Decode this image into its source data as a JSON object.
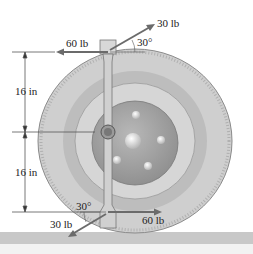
{
  "diagram": {
    "type": "wrench-on-tire-forces",
    "forces": {
      "top_horizontal": "60 lb",
      "top_angled": "30 lb",
      "bottom_horizontal": "60 lb",
      "bottom_angled": "30 lb"
    },
    "angles": {
      "top": "30°",
      "bottom": "30°"
    },
    "dimensions": {
      "upper": "16 in",
      "lower": "16 in"
    },
    "colors": {
      "tire": "#c9c9c9",
      "tire_inner": "#b5b5b5",
      "hub": "#9e9e9e",
      "force_arrow": "#6b6b6b",
      "ground": "#c4c4c4"
    }
  }
}
